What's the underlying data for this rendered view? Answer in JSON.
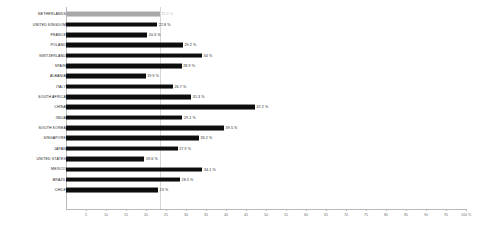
{
  "chart_data": {
    "type": "bar",
    "orientation": "horizontal",
    "title": "",
    "subtitle": "",
    "xlabel": "",
    "ylabel": "",
    "xlim": [
      0,
      100
    ],
    "tick_step": 5,
    "grid": false,
    "legend": "none",
    "value_suffix": "%",
    "reference_line_value": 23.4,
    "highlight_category": "NETHERLANDS",
    "colors": {
      "bar": "#0d0d0d",
      "highlight_bar": "#a8a8a8",
      "axis": "#b9b9b9",
      "reference_line": "#d6d6d6",
      "label": "#1a1a1a",
      "muted_label": "#bdbdbd",
      "background": "#ffffff"
    },
    "categories": [
      "NETHERLANDS",
      "UNITED KINGDOM",
      "FRANCE",
      "POLAND",
      "SWITZERLAND",
      "SPAIN",
      "ALBANIA",
      "ITALY",
      "SOUTH AFRICA",
      "CHINA",
      "INDIA",
      "SOUTH KOREA",
      "SINGAPORE",
      "JAPAN",
      "UNITED STATES",
      "MEXICO",
      "BRAZIL",
      "CHILE"
    ],
    "values": [
      23.4,
      22.8,
      20.3,
      29.2,
      34,
      28.9,
      19.9,
      26.7,
      31.3,
      47.2,
      29.1,
      39.5,
      33.2,
      27.9,
      19.6,
      34.1,
      28.5,
      23
    ],
    "value_labels": [
      "23.4 %",
      "22.8 %",
      "20.3 %",
      "29.2 %",
      "34 %",
      "28.9 %",
      "19.9 %",
      "26.7 %",
      "31.3 %",
      "47.2 %",
      "29.1 %",
      "39.5 %",
      "33.2 %",
      "27.9 %",
      "19.6 %",
      "34.1 %",
      "28.5 %",
      "23 %"
    ],
    "tick_labels": [
      "5",
      "10",
      "15",
      "20",
      "25",
      "30",
      "35",
      "40",
      "45",
      "50",
      "55",
      "60",
      "65",
      "70",
      "75",
      "80",
      "85",
      "90",
      "95",
      "100 %"
    ],
    "tick_values": [
      5,
      10,
      15,
      20,
      25,
      30,
      35,
      40,
      45,
      50,
      55,
      60,
      65,
      70,
      75,
      80,
      85,
      90,
      95,
      100
    ]
  }
}
